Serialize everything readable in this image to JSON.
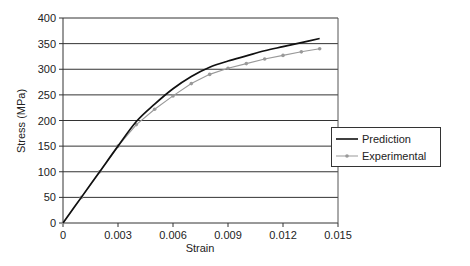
{
  "chart_data": {
    "type": "line",
    "title": "",
    "xlabel": "Strain",
    "ylabel": "Stress (MPa)",
    "xlim": [
      0,
      0.015
    ],
    "ylim": [
      0,
      400
    ],
    "x_ticks": [
      "0",
      "0.003",
      "0.006",
      "0.009",
      "0.012",
      "0.015"
    ],
    "y_ticks": [
      "0",
      "50",
      "100",
      "150",
      "200",
      "250",
      "300",
      "350",
      "400"
    ],
    "grid": "horizontal",
    "legend_position": "right",
    "series": [
      {
        "name": "Prediction",
        "color": "#111111",
        "marker": "none",
        "x": [
          0,
          0.001,
          0.002,
          0.003,
          0.004,
          0.005,
          0.006,
          0.007,
          0.008,
          0.009,
          0.01,
          0.011,
          0.012,
          0.013,
          0.014
        ],
        "values": [
          0,
          50,
          100,
          150,
          198,
          232,
          262,
          286,
          304,
          316,
          326,
          336,
          344,
          352,
          360
        ]
      },
      {
        "name": "Experimental",
        "color": "#999999",
        "marker": "circle",
        "x": [
          0,
          0.001,
          0.002,
          0.003,
          0.004,
          0.005,
          0.006,
          0.007,
          0.008,
          0.009,
          0.01,
          0.011,
          0.012,
          0.013,
          0.014
        ],
        "values": [
          0,
          50,
          100,
          150,
          192,
          222,
          248,
          272,
          290,
          302,
          311,
          320,
          327,
          334,
          340
        ]
      }
    ]
  },
  "legend": {
    "items": [
      "Prediction",
      "Experimental"
    ]
  }
}
